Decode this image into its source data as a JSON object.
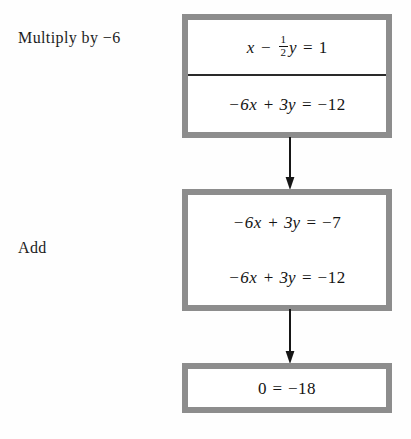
{
  "diagram": {
    "title_absent": true,
    "border_color": "#8d8d8d",
    "text_color": "#141414",
    "background": "#ffffff"
  },
  "labels": {
    "multiply": "Multiply by −6",
    "add": "Add"
  },
  "boxes": [
    {
      "id": "box-1",
      "name": "system-box-multiply",
      "divider": true,
      "rows": [
        {
          "id": "eq-1-1",
          "plain": "x − ½y = 1",
          "lhs_var_1": "x",
          "op_1": "−",
          "frac_numer": "1",
          "frac_denom": "2",
          "lhs_var_2": "y",
          "relation": "=",
          "rhs": "1"
        },
        {
          "id": "eq-1-2",
          "plain": "−6x + 3y = −12",
          "term_1": "−6x",
          "op_1": "+",
          "term_2": "3y",
          "relation": "=",
          "rhs": "−12"
        }
      ]
    },
    {
      "id": "box-2",
      "name": "system-box-add",
      "divider": false,
      "rows": [
        {
          "id": "eq-2-1",
          "plain": "−6x + 3y = −7",
          "term_1": "−6x",
          "op_1": "+",
          "term_2": "3y",
          "relation": "=",
          "rhs": "−7"
        },
        {
          "id": "eq-2-2",
          "plain": "−6x + 3y = −12",
          "term_1": "−6x",
          "op_1": "+",
          "term_2": "3y",
          "relation": "=",
          "rhs": "−12"
        }
      ]
    },
    {
      "id": "box-3",
      "name": "result-box",
      "divider": false,
      "rows": [
        {
          "id": "eq-3-1",
          "plain": "0 = −18",
          "lhs": "0",
          "relation": "=",
          "rhs": "−18"
        }
      ]
    }
  ],
  "arrows": [
    {
      "id": "arrow-1",
      "from": "box-1",
      "to": "box-2",
      "direction": "down"
    },
    {
      "id": "arrow-2",
      "from": "box-2",
      "to": "box-3",
      "direction": "down"
    }
  ]
}
